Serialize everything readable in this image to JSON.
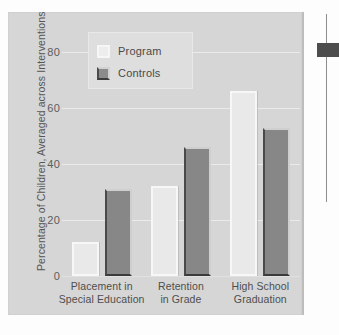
{
  "chart_data": {
    "type": "bar",
    "title": "",
    "xlabel": "",
    "ylabel": "Percentage of Children, Averaged across Interventions",
    "ylim": [
      0,
      85
    ],
    "yticks": [
      0,
      20,
      40,
      60,
      80
    ],
    "ytick_labels": [
      "0",
      "20",
      "40",
      "60",
      "80"
    ],
    "grid": true,
    "legend_position": "upper-left-inside",
    "categories": [
      "Placement in Special Education",
      "Retention in Grade",
      "High School Graduation"
    ],
    "category_lines": [
      [
        "Placement in",
        "Special Education"
      ],
      [
        "Retention",
        "in Grade"
      ],
      [
        "High School",
        "Graduation"
      ]
    ],
    "series": [
      {
        "name": "Program",
        "values": [
          12,
          32,
          66
        ],
        "color": "#ededed"
      },
      {
        "name": "Controls",
        "values": [
          31,
          46,
          53
        ],
        "color": "#878787"
      }
    ]
  },
  "legend": {
    "items": [
      {
        "label": "Program"
      },
      {
        "label": "Controls"
      }
    ]
  },
  "colors": {
    "panel_background": "#d6d6d6",
    "program_fill": "#e9e9e9",
    "controls_fill": "#878787",
    "gridline": "#eceaea",
    "text": "#4e4e4e",
    "marker": "#4d4d4d"
  }
}
